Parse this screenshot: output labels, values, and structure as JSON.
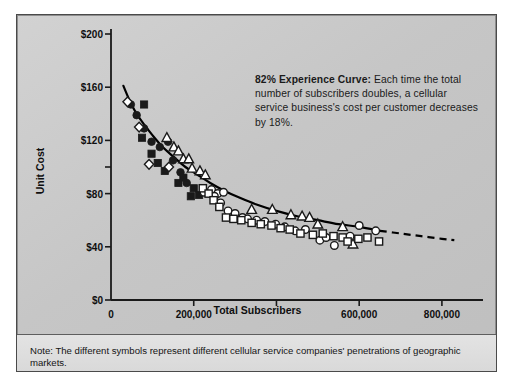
{
  "figure": {
    "callout": {
      "lead": "82% Experience Curve:",
      "body": " Each time the total number of subscribers doubles, a cellular service business's cost per customer decreases by 18%."
    },
    "note": "Note: The different symbols represent different cellular service companies' penetrations of geographic markets.",
    "colors": {
      "panel_background": "#c9c9c9",
      "note_background": "#dedede",
      "frame_border": "#4a4a4a",
      "axis": "#1a1a1a",
      "curve": "#000000",
      "text": "#141414",
      "symbol_fill_dark": "#1a1a1a",
      "symbol_fill_light": "#ffffff"
    }
  },
  "chart_data": {
    "type": "scatter",
    "title": "",
    "subtitle": "",
    "xlabel": "Total Subscribers",
    "ylabel": "Unit Cost",
    "xlim": [
      0,
      880000
    ],
    "ylim": [
      0,
      200
    ],
    "grid": false,
    "legend_position": "none",
    "annotations": [
      {
        "text": "82% Experience Curve: Each time the total number of subscribers doubles, a cellular service business's cost per customer decreases by 18%.",
        "x": 430000,
        "y": 175
      }
    ],
    "xticks": [
      {
        "value": 0,
        "label": "0"
      },
      {
        "value": 200000,
        "label": "200,000"
      },
      {
        "value": 400000,
        "label": ""
      },
      {
        "value": 600000,
        "label": "600,000"
      },
      {
        "value": 800000,
        "label": "800,000"
      }
    ],
    "yticks": [
      {
        "value": 0,
        "label": "$0"
      },
      {
        "value": 40,
        "label": "$40"
      },
      {
        "value": 80,
        "label": "$80"
      },
      {
        "value": 100,
        "label": ""
      },
      {
        "value": 120,
        "label": "$120"
      },
      {
        "value": 160,
        "label": "$160"
      },
      {
        "value": 200,
        "label": "$200"
      }
    ],
    "fit_curve": {
      "name": "82% experience curve",
      "style_solid": "solid",
      "style_extension": "dashed",
      "solid_points": [
        [
          30000,
          161
        ],
        [
          45000,
          150
        ],
        [
          60000,
          141
        ],
        [
          80000,
          132
        ],
        [
          100000,
          124
        ],
        [
          125000,
          115
        ],
        [
          150000,
          108
        ],
        [
          180000,
          100
        ],
        [
          210000,
          94
        ],
        [
          240000,
          88
        ],
        [
          275000,
          82
        ],
        [
          310000,
          77
        ],
        [
          350000,
          72
        ],
        [
          400000,
          67
        ],
        [
          450000,
          63
        ],
        [
          500000,
          60
        ],
        [
          550000,
          57
        ],
        [
          600000,
          55
        ],
        [
          650000,
          52
        ]
      ],
      "dashed_points": [
        [
          650000,
          52
        ],
        [
          700000,
          50
        ],
        [
          750000,
          48
        ],
        [
          800000,
          46
        ],
        [
          830000,
          45
        ]
      ]
    },
    "series": [
      {
        "name": "Company A",
        "marker": "filled-circle",
        "points": [
          [
            48000,
            147
          ],
          [
            62000,
            139
          ],
          [
            80000,
            129
          ],
          [
            98000,
            119
          ],
          [
            118000,
            115
          ],
          [
            138000,
            119
          ],
          [
            150000,
            105
          ],
          [
            168000,
            96
          ],
          [
            183000,
            88
          ]
        ]
      },
      {
        "name": "Company B",
        "marker": "filled-square",
        "points": [
          [
            80000,
            147
          ],
          [
            75000,
            122
          ],
          [
            98000,
            110
          ],
          [
            113000,
            103
          ],
          [
            130000,
            97
          ],
          [
            163000,
            88
          ],
          [
            175000,
            92
          ],
          [
            193000,
            78
          ],
          [
            200000,
            84
          ],
          [
            213000,
            79
          ]
        ]
      },
      {
        "name": "Company C",
        "marker": "open-diamond",
        "points": [
          [
            40000,
            149
          ],
          [
            68000,
            130
          ],
          [
            92000,
            102
          ],
          [
            140000,
            100
          ]
        ]
      },
      {
        "name": "Company D",
        "marker": "open-triangle",
        "points": [
          [
            135000,
            122
          ],
          [
            152000,
            115
          ],
          [
            163000,
            112
          ],
          [
            175000,
            106
          ],
          [
            188000,
            106
          ],
          [
            196000,
            99
          ],
          [
            215000,
            97
          ],
          [
            228000,
            94
          ],
          [
            340000,
            68
          ],
          [
            390000,
            68
          ],
          [
            435000,
            64
          ],
          [
            462000,
            63
          ],
          [
            480000,
            62
          ],
          [
            500000,
            57
          ],
          [
            560000,
            55
          ],
          [
            585000,
            42
          ]
        ]
      },
      {
        "name": "Company E",
        "marker": "open-circle",
        "points": [
          [
            225000,
            81
          ],
          [
            243000,
            83
          ],
          [
            258000,
            80
          ],
          [
            272000,
            81
          ],
          [
            250000,
            78
          ],
          [
            265000,
            73
          ],
          [
            283000,
            67
          ],
          [
            300000,
            65
          ],
          [
            318000,
            62
          ],
          [
            330000,
            61
          ],
          [
            352000,
            60
          ],
          [
            372000,
            59
          ],
          [
            398000,
            57
          ],
          [
            420000,
            55
          ],
          [
            445000,
            52
          ],
          [
            470000,
            53
          ],
          [
            505000,
            45
          ],
          [
            520000,
            47
          ],
          [
            540000,
            41
          ],
          [
            578000,
            48
          ],
          [
            600000,
            56
          ],
          [
            640000,
            52
          ]
        ]
      },
      {
        "name": "Company F",
        "marker": "open-square",
        "points": [
          [
            222000,
            84
          ],
          [
            236000,
            80
          ],
          [
            248000,
            75
          ],
          [
            262000,
            70
          ],
          [
            278000,
            62
          ],
          [
            296000,
            61
          ],
          [
            315000,
            60
          ],
          [
            340000,
            58
          ],
          [
            362000,
            57
          ],
          [
            388000,
            56
          ],
          [
            410000,
            54
          ],
          [
            432000,
            53
          ],
          [
            458000,
            50
          ],
          [
            488000,
            49
          ],
          [
            512000,
            50
          ],
          [
            538000,
            48
          ],
          [
            560000,
            47
          ],
          [
            572000,
            44
          ],
          [
            598000,
            46
          ],
          [
            620000,
            47
          ],
          [
            648000,
            44
          ]
        ]
      }
    ]
  }
}
